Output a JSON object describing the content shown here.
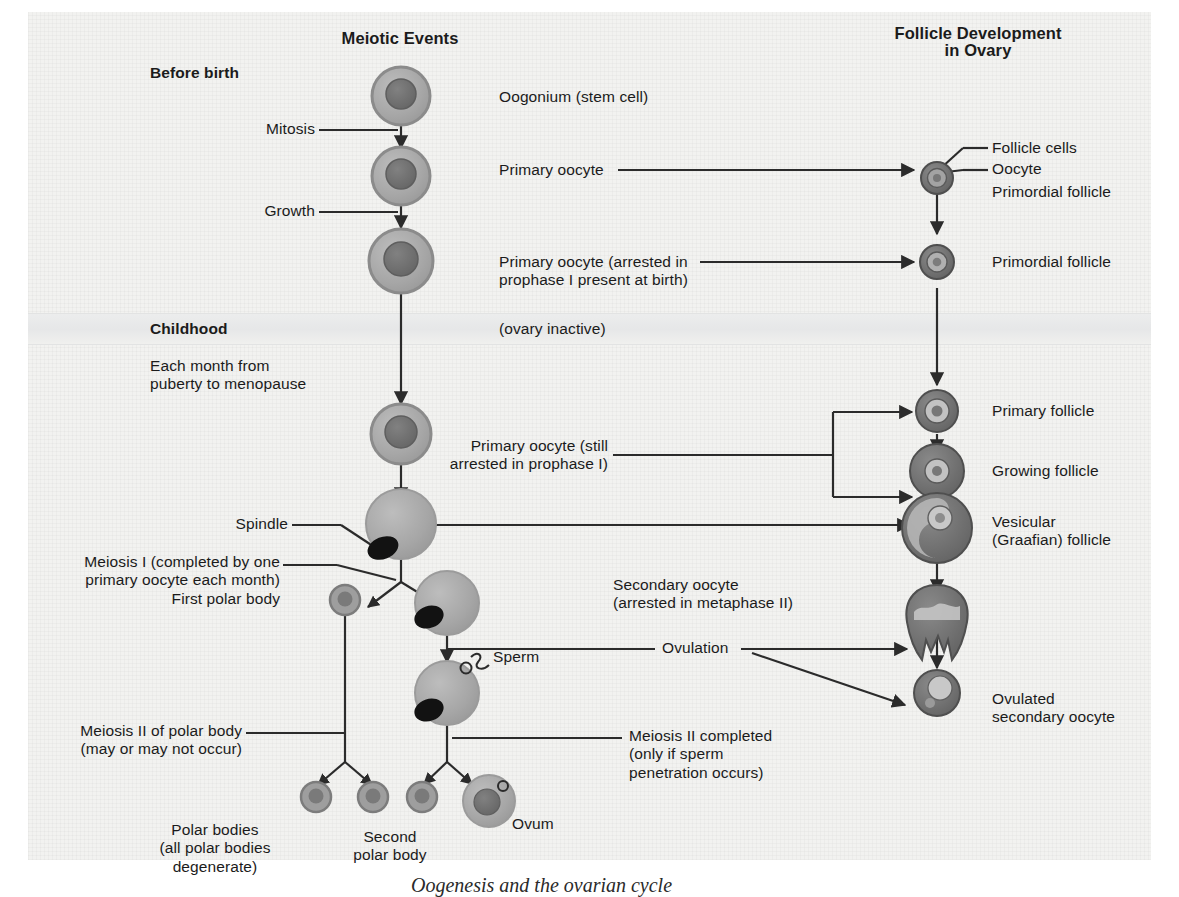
{
  "figure": {
    "caption": "Oogenesis and the ovarian cycle",
    "columns": {
      "meiotic_events_title": "Meiotic Events",
      "follicle_title_line1": "Follicle Development",
      "follicle_title_line2": "in Ovary"
    }
  },
  "stages": {
    "before_birth": "Before birth",
    "childhood": "Childhood",
    "monthly": "Each month from\npuberty to menopause"
  },
  "meiotic_labels": {
    "mitosis": "Mitosis",
    "growth": "Growth",
    "spindle": "Spindle",
    "meiosis_i": "Meiosis I (completed by one\nprimary oocyte each month)",
    "first_polar_body": "First polar body",
    "meiosis_ii_polar": "Meiosis II of polar body\n(may or may not occur)",
    "polar_bodies": "Polar bodies\n(all polar bodies\ndegenerate)",
    "second_polar_body": "Second\npolar body",
    "ovum": "Ovum",
    "sperm": "Sperm"
  },
  "center_labels": {
    "oogonium": "Oogonium (stem cell)",
    "primary_oocyte": "Primary oocyte",
    "primary_oocyte_arrested": "Primary oocyte (arrested in\nprophase I present at birth)",
    "ovary_inactive": "(ovary inactive)",
    "primary_oocyte_still": "Primary oocyte (still\narrested in prophase I)",
    "secondary_oocyte": "Secondary oocyte\n(arrested in metaphase II)",
    "ovulation": "Ovulation",
    "meiosis_ii_completed": "Meiosis II completed\n(only if sperm\npenetration occurs)"
  },
  "follicle_labels": {
    "follicle_cells": "Follicle cells",
    "oocyte": "Oocyte",
    "primordial_follicle_1": "Primordial follicle",
    "primordial_follicle_2": "Primordial follicle",
    "primary_follicle": "Primary follicle",
    "growing_follicle": "Growing follicle",
    "vesicular_follicle": "Vesicular\n(Graafian) follicle",
    "ovulated_secondary_oocyte": "Ovulated\nsecondary oocyte"
  },
  "colors": {
    "background": "#f2f2f0",
    "cell_cytoplasm": "#a8a8a8",
    "cell_membrane": "#8e8e8e",
    "nucleus": "#6e6e6e",
    "spindle": "#1a1a1a",
    "line": "#2b2b2b",
    "text": "#1b1b1b",
    "follicle_dark": "#6f6f6f",
    "antrum": "#c9c9c9"
  }
}
